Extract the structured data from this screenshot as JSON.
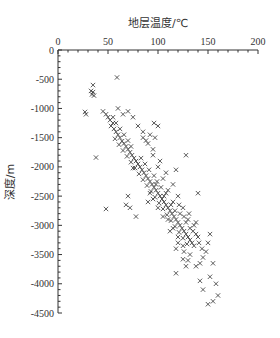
{
  "chart_data": {
    "type": "scatter",
    "title": "",
    "xlabel": "地层温度/℃",
    "ylabel": "深度/m",
    "x_axis_position": "top",
    "xlim": [
      0,
      200
    ],
    "ylim": [
      -4500,
      0
    ],
    "x_ticks": [
      0,
      50,
      100,
      150,
      200
    ],
    "y_ticks": [
      0,
      -500,
      -1000,
      -1500,
      -2000,
      -2500,
      -3000,
      -3500,
      -4000,
      -4500
    ],
    "x_tick_labels": [
      "0",
      "50",
      "100",
      "150",
      "200"
    ],
    "y_tick_labels": [
      "0",
      "-500",
      "-1000",
      "-1500",
      "-2000",
      "-2500",
      "-3000",
      "-3500",
      "-4000",
      "-4500"
    ],
    "grid": false,
    "legend": null,
    "marker": "x",
    "marker_color": "#333333",
    "series": [
      {
        "name": "温度-深度",
        "points": [
          [
            35,
            -600
          ],
          [
            33,
            -700
          ],
          [
            35,
            -720
          ],
          [
            34,
            -760
          ],
          [
            36,
            -780
          ],
          [
            59,
            -470
          ],
          [
            27,
            -1060
          ],
          [
            28,
            -1100
          ],
          [
            38,
            -1840
          ],
          [
            48,
            -2720
          ],
          [
            45,
            -1050
          ],
          [
            48,
            -1100
          ],
          [
            50,
            -1150
          ],
          [
            52,
            -1200
          ],
          [
            55,
            -1250
          ],
          [
            53,
            -1300
          ],
          [
            56,
            -1350
          ],
          [
            58,
            -1400
          ],
          [
            60,
            -1450
          ],
          [
            62,
            -1500
          ],
          [
            57,
            -1520
          ],
          [
            64,
            -1560
          ],
          [
            66,
            -1600
          ],
          [
            61,
            -1620
          ],
          [
            68,
            -1650
          ],
          [
            70,
            -1700
          ],
          [
            65,
            -1720
          ],
          [
            72,
            -1750
          ],
          [
            74,
            -1800
          ],
          [
            69,
            -1820
          ],
          [
            76,
            -1850
          ],
          [
            78,
            -1900
          ],
          [
            73,
            -1920
          ],
          [
            80,
            -1950
          ],
          [
            82,
            -2000
          ],
          [
            77,
            -2020
          ],
          [
            84,
            -2050
          ],
          [
            86,
            -2100
          ],
          [
            81,
            -2120
          ],
          [
            88,
            -2150
          ],
          [
            90,
            -2200
          ],
          [
            85,
            -2220
          ],
          [
            92,
            -2250
          ],
          [
            94,
            -2300
          ],
          [
            89,
            -2320
          ],
          [
            96,
            -2350
          ],
          [
            98,
            -2400
          ],
          [
            93,
            -2420
          ],
          [
            100,
            -2450
          ],
          [
            102,
            -2500
          ],
          [
            97,
            -2520
          ],
          [
            104,
            -2550
          ],
          [
            106,
            -2600
          ],
          [
            101,
            -2620
          ],
          [
            108,
            -2650
          ],
          [
            110,
            -2700
          ],
          [
            105,
            -2720
          ],
          [
            112,
            -2750
          ],
          [
            114,
            -2800
          ],
          [
            109,
            -2820
          ],
          [
            116,
            -2850
          ],
          [
            118,
            -2900
          ],
          [
            113,
            -2920
          ],
          [
            120,
            -2950
          ],
          [
            122,
            -3000
          ],
          [
            117,
            -3020
          ],
          [
            124,
            -3050
          ],
          [
            126,
            -3100
          ],
          [
            121,
            -3120
          ],
          [
            128,
            -3150
          ],
          [
            130,
            -3200
          ],
          [
            125,
            -3220
          ],
          [
            132,
            -3250
          ],
          [
            134,
            -3300
          ],
          [
            129,
            -3320
          ],
          [
            136,
            -3350
          ],
          [
            96,
            -1250
          ],
          [
            100,
            -1300
          ],
          [
            92,
            -1450
          ],
          [
            97,
            -1500
          ],
          [
            75,
            -2020
          ],
          [
            70,
            -2500
          ],
          [
            68,
            -2650
          ],
          [
            72,
            -2700
          ],
          [
            78,
            -2850
          ],
          [
            92,
            -2450
          ],
          [
            90,
            -2600
          ],
          [
            118,
            -2050
          ],
          [
            128,
            -1800
          ],
          [
            140,
            -2450
          ],
          [
            138,
            -2950
          ],
          [
            152,
            -3150
          ],
          [
            150,
            -3300
          ],
          [
            148,
            -3450
          ],
          [
            125,
            -3580
          ],
          [
            118,
            -3820
          ],
          [
            128,
            -3700
          ],
          [
            155,
            -3650
          ],
          [
            152,
            -3880
          ],
          [
            158,
            -4000
          ],
          [
            160,
            -4200
          ],
          [
            155,
            -4300
          ],
          [
            150,
            -4350
          ],
          [
            145,
            -4100
          ],
          [
            142,
            -3950
          ],
          [
            85,
            -1400
          ],
          [
            88,
            -1550
          ],
          [
            95,
            -1700
          ],
          [
            102,
            -1900
          ],
          [
            108,
            -2100
          ],
          [
            115,
            -2300
          ],
          [
            120,
            -2500
          ],
          [
            125,
            -2700
          ],
          [
            130,
            -2900
          ],
          [
            135,
            -3100
          ],
          [
            140,
            -3200
          ],
          [
            115,
            -2600
          ],
          [
            110,
            -2400
          ],
          [
            105,
            -2200
          ],
          [
            100,
            -2000
          ],
          [
            95,
            -1800
          ],
          [
            90,
            -1600
          ],
          [
            85,
            -1500
          ],
          [
            80,
            -1300
          ],
          [
            75,
            -1150
          ],
          [
            70,
            -1050
          ],
          [
            65,
            -1100
          ],
          [
            60,
            -1000
          ],
          [
            110,
            -2900
          ],
          [
            115,
            -3050
          ],
          [
            120,
            -3200
          ],
          [
            125,
            -3350
          ],
          [
            112,
            -3100
          ],
          [
            118,
            -3400
          ],
          [
            105,
            -2850
          ],
          [
            100,
            -2700
          ],
          [
            95,
            -2550
          ],
          [
            122,
            -2800
          ],
          [
            128,
            -2950
          ],
          [
            132,
            -3050
          ],
          [
            138,
            -3150
          ],
          [
            126,
            -3450
          ],
          [
            132,
            -3500
          ],
          [
            120,
            -3300
          ],
          [
            106,
            -2500
          ],
          [
            98,
            -2300
          ],
          [
            103,
            -2350
          ],
          [
            108,
            -2450
          ],
          [
            113,
            -2650
          ],
          [
            117,
            -2750
          ],
          [
            121,
            -2650
          ],
          [
            126,
            -2850
          ],
          [
            131,
            -2800
          ],
          [
            136,
            -3000
          ],
          [
            141,
            -3300
          ],
          [
            144,
            -3400
          ],
          [
            62,
            -1350
          ],
          [
            58,
            -1250
          ],
          [
            55,
            -1150
          ],
          [
            66,
            -1450
          ],
          [
            70,
            -1550
          ],
          [
            73,
            -1650
          ],
          [
            83,
            -1850
          ],
          [
            87,
            -1950
          ],
          [
            91,
            -2050
          ],
          [
            96,
            -2150
          ],
          [
            99,
            -2250
          ],
          [
            145,
            -3550
          ],
          [
            142,
            -3650
          ],
          [
            130,
            -3600
          ],
          [
            138,
            -3700
          ]
        ]
      }
    ]
  }
}
